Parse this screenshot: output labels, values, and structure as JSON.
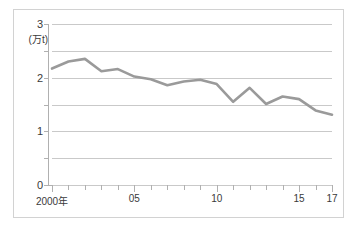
{
  "chart_data": {
    "type": "line",
    "title": "",
    "subtitle": "",
    "xlabel": "",
    "ylabel": "",
    "unit_label": "(万t)",
    "grid": true,
    "legend": "none",
    "xlim": [
      2000,
      2017
    ],
    "ylim": [
      0,
      3
    ],
    "y_ticks": [
      0,
      1,
      2,
      3
    ],
    "y_tick_labels": [
      "0",
      "1",
      "2",
      "3"
    ],
    "y_minor_ticks": [
      0.5,
      1.5,
      2.5
    ],
    "x": [
      2000,
      2001,
      2002,
      2003,
      2004,
      2005,
      2006,
      2007,
      2008,
      2009,
      2010,
      2011,
      2012,
      2013,
      2014,
      2015,
      2016,
      2017
    ],
    "x_tick_labels": [
      {
        "x": 2000,
        "label": "2000年"
      },
      {
        "x": 2005,
        "label": "05"
      },
      {
        "x": 2010,
        "label": "10"
      },
      {
        "x": 2015,
        "label": "15"
      },
      {
        "x": 2017,
        "label": "17"
      }
    ],
    "series": [
      {
        "name": "",
        "color": "#9a9a9a",
        "values": [
          2.17,
          2.3,
          2.35,
          2.12,
          2.16,
          2.02,
          1.97,
          1.86,
          1.93,
          1.96,
          1.88,
          1.55,
          1.81,
          1.51,
          1.65,
          1.6,
          1.39,
          1.31
        ]
      }
    ]
  },
  "axis": {
    "y_labels": [
      "3",
      "2",
      "1",
      "0"
    ],
    "unit": "(万t)",
    "x_labels": [
      "2000年",
      "05",
      "10",
      "15",
      "17"
    ]
  },
  "colors": {
    "line": "#9a9a9a",
    "grid": "#c9c9c9",
    "axis": "#b0b0b0",
    "frame": "#d2d2d2",
    "text": "#3a3a3a",
    "background": "#ffffff"
  }
}
